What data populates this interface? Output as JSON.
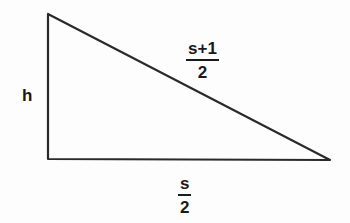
{
  "diagram": {
    "shape": "right-triangle",
    "vertices": [
      [
        48,
        14
      ],
      [
        48,
        159
      ],
      [
        330,
        160
      ]
    ],
    "stroke_color": "#2a2a2a",
    "labels": {
      "height": "h",
      "hypotenuse": {
        "numerator": "s+1",
        "denominator": "2"
      },
      "base": {
        "numerator": "s",
        "denominator": "2"
      }
    }
  }
}
